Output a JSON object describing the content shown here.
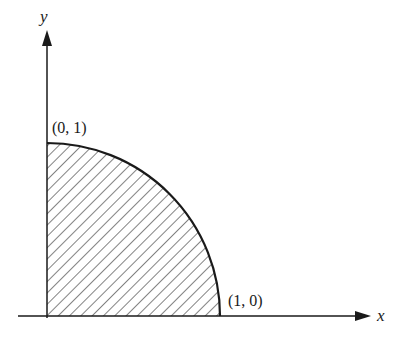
{
  "diagram": {
    "type": "quarter-circle-region",
    "x_axis_label": "x",
    "y_axis_label": "y",
    "points": [
      {
        "label": "(0, 1)",
        "x": 0,
        "y": 1
      },
      {
        "label": "(1, 0)",
        "x": 1,
        "y": 0
      }
    ],
    "region": "shaded quarter disk in first quadrant",
    "colors": {
      "ink": "#1a1a1a",
      "background": "#ffffff"
    }
  }
}
